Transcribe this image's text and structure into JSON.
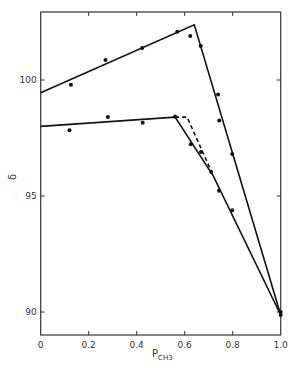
{
  "chart_data": {
    "type": "line",
    "title": "",
    "xlabel": "P",
    "xlabel_subscript": "CH3",
    "ylabel": "δ",
    "xlim": [
      0,
      1.0
    ],
    "ylim": [
      89.0,
      103.0
    ],
    "x_ticks": [
      "0",
      "0.2",
      "0.4",
      "0.6",
      "0.8",
      "1.0"
    ],
    "x_tick_values": [
      0,
      0.2,
      0.4,
      0.6,
      0.8,
      1.0
    ],
    "y_ticks": [
      "90",
      "95",
      "100"
    ],
    "y_tick_values": [
      90,
      95,
      100
    ],
    "grid": false,
    "legend": null,
    "series": [
      {
        "name": "upper fit",
        "style": "solid",
        "x": [
          0,
          0.64,
          1.0
        ],
        "y": [
          99.45,
          102.38,
          89.87
        ]
      },
      {
        "name": "lower fit",
        "style": "solid",
        "x": [
          0,
          0.56,
          0.72,
          1.0
        ],
        "y": [
          98.0,
          98.4,
          95.85,
          89.87
        ]
      },
      {
        "name": "lower fit (alternate)",
        "style": "dashed",
        "x": [
          0.56,
          0.61,
          0.72
        ],
        "y": [
          98.4,
          98.4,
          95.85
        ]
      },
      {
        "name": "upper data",
        "style": "points",
        "x": [
          0.126,
          0.27,
          0.423,
          0.569,
          0.623,
          0.667,
          0.739,
          0.744,
          0.798,
          1.0
        ],
        "y": [
          99.8,
          100.86,
          101.38,
          102.08,
          101.9,
          101.47,
          99.37,
          98.25,
          96.81,
          90.0
        ]
      },
      {
        "name": "lower data",
        "style": "points",
        "x": [
          0.12,
          0.28,
          0.425,
          0.56,
          0.625,
          0.668,
          0.71,
          0.743,
          0.798,
          1.0
        ],
        "y": [
          97.83,
          98.41,
          98.16,
          98.43,
          97.23,
          96.9,
          96.05,
          95.23,
          94.39,
          89.87
        ]
      }
    ]
  }
}
